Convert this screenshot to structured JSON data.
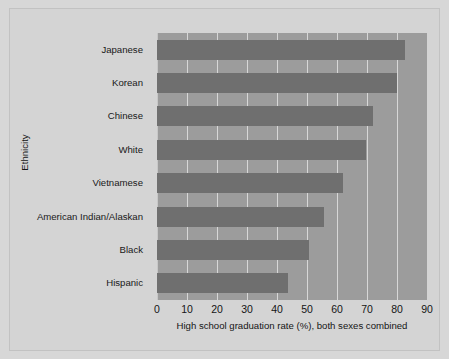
{
  "chart_data": {
    "type": "bar",
    "orientation": "horizontal",
    "title": "",
    "xlabel": "High school graduation rate (%), both sexes combined",
    "ylabel": "Ethnicity",
    "categories": [
      "Japanese",
      "Korean",
      "Chinese",
      "White",
      "Vietnamese",
      "American Indian/Alaskan",
      "Black",
      "Hispanic"
    ],
    "values": [
      82.5,
      80.0,
      72.0,
      69.5,
      62.0,
      55.5,
      50.5,
      43.5
    ],
    "xlim": [
      0,
      90
    ],
    "xticks": [
      0,
      10,
      20,
      30,
      40,
      50,
      60,
      70,
      80,
      90
    ],
    "xtick_labels": [
      "0",
      "10",
      "20",
      "30",
      "40",
      "50",
      "60",
      "70",
      "80",
      "90"
    ],
    "grid": "vertical",
    "legend": "none",
    "colors": {
      "figure_background": "#d7d7d7",
      "plot_background": "#9c9c9c",
      "bar": "#6f6f6f",
      "gridline": "#e2e2e2",
      "text": "#141414"
    }
  }
}
